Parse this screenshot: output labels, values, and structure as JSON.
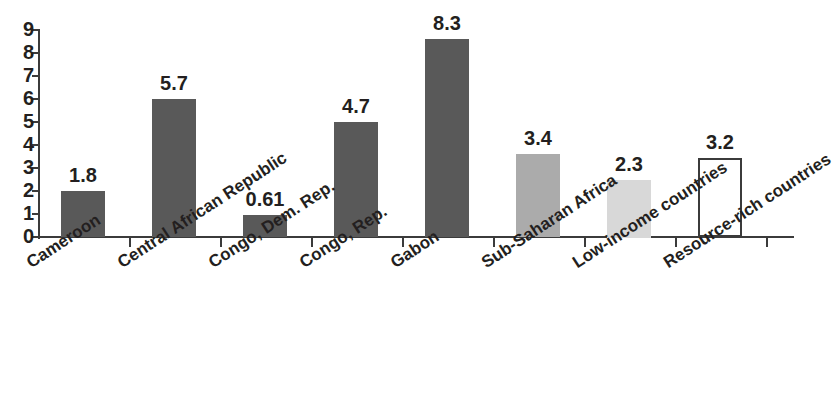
{
  "chart_data": {
    "type": "bar",
    "title": "",
    "subtitle": "",
    "xlabel": "",
    "ylabel": "",
    "ylim": [
      0,
      9
    ],
    "ytick_labels": [
      "0",
      "1",
      "2",
      "3",
      "4",
      "5",
      "6",
      "7",
      "8",
      "9"
    ],
    "grid": false,
    "legend": "none",
    "categories": [
      "Cameroon",
      "Central African Republic",
      "Congo, Dem. Rep.",
      "Congo, Rep.",
      "Gabon",
      "Sub-Saharan Africa",
      "Low-income countries",
      "Resource-rich countries"
    ],
    "values": [
      1.8,
      5.7,
      0.61,
      4.7,
      8.3,
      3.4,
      2.3,
      3.2
    ],
    "value_labels": [
      "1.8",
      "5.7",
      "0.61",
      "4.7",
      "8.3",
      "3.4",
      "2.3",
      "3.2"
    ],
    "drawn_heights": [
      2.0,
      6.0,
      0.95,
      5.0,
      8.6,
      3.6,
      2.5,
      3.45
    ],
    "bar_styles": [
      "dark",
      "dark",
      "dark",
      "dark",
      "dark",
      "medium",
      "light",
      "outline"
    ],
    "colors": {
      "dark": "#595959",
      "medium": "#ababab",
      "light": "#d8d8d8",
      "outline_fill": "#ffffff",
      "outline_stroke": "#3b3b3b",
      "axis": "#3b3b3b",
      "text": "#231f20",
      "background": "#ffffff"
    }
  }
}
